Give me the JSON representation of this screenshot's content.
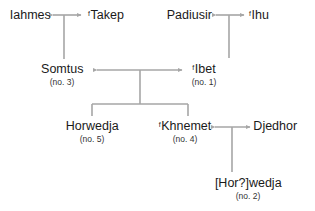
{
  "diagram": {
    "type": "family-tree",
    "line_color": "#a6a6a6",
    "text_color": "#1a1a1a",
    "persons": [
      {
        "id": "iahmes",
        "prefix": "",
        "name": "Iahmes",
        "number": ""
      },
      {
        "id": "takep",
        "prefix": "f",
        "name": "Takep",
        "number": ""
      },
      {
        "id": "padiusir",
        "prefix": "",
        "name": "Padiusir",
        "number": ""
      },
      {
        "id": "ihu",
        "prefix": "f",
        "name": "Ihu",
        "number": ""
      },
      {
        "id": "somtus",
        "prefix": "",
        "name": "Somtus",
        "number": "(no. 3)"
      },
      {
        "id": "ibet",
        "prefix": "f",
        "name": "Ibet",
        "number": "(no. 1)"
      },
      {
        "id": "horwedja",
        "prefix": "",
        "name": "Horwedja",
        "number": "(no. 5)"
      },
      {
        "id": "khnemet",
        "prefix": "f",
        "name": "Khnemet",
        "number": "(no. 4)"
      },
      {
        "id": "djedhor",
        "prefix": "",
        "name": "Djedhor",
        "number": ""
      },
      {
        "id": "horwedja2",
        "prefix": "",
        "name": "[Hor?]wedja",
        "number": "(no. 2)"
      }
    ],
    "marriages": [
      {
        "a": "iahmes",
        "b": "takep"
      },
      {
        "a": "padiusir",
        "b": "ihu"
      },
      {
        "a": "somtus",
        "b": "ibet"
      },
      {
        "a": "khnemet",
        "b": "djedhor"
      }
    ],
    "descents": [
      {
        "parents": [
          "iahmes",
          "takep"
        ],
        "children": [
          "somtus"
        ]
      },
      {
        "parents": [
          "padiusir",
          "ihu"
        ],
        "children": [
          "ibet"
        ]
      },
      {
        "parents": [
          "somtus",
          "ibet"
        ],
        "children": [
          "horwedja",
          "khnemet"
        ]
      },
      {
        "parents": [
          "khnemet",
          "djedhor"
        ],
        "children": [
          "horwedja2"
        ]
      }
    ]
  }
}
